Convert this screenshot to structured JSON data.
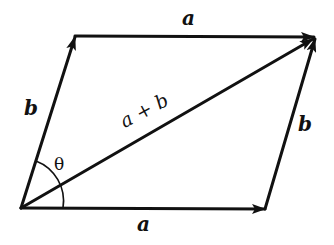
{
  "diagram": {
    "labels": {
      "top_a": "a",
      "bottom_a": "a",
      "left_b": "b",
      "right_b": "b",
      "sum": "a + b",
      "angle": "θ"
    },
    "points": {
      "origin": [
        21,
        208
      ],
      "b_tip": [
        75,
        37
      ],
      "sum_tip": [
        315,
        38
      ],
      "a_tip": [
        265,
        209
      ]
    },
    "vectors": [
      {
        "name": "a",
        "from": "origin",
        "to": "a_tip"
      },
      {
        "name": "b",
        "from": "origin",
        "to": "b_tip"
      },
      {
        "name": "a",
        "from": "b_tip",
        "to": "sum_tip"
      },
      {
        "name": "b",
        "from": "a_tip",
        "to": "sum_tip"
      },
      {
        "name": "a + b",
        "from": "origin",
        "to": "sum_tip"
      }
    ],
    "colors": {
      "line": "#111111",
      "background": "#ffffff"
    }
  }
}
